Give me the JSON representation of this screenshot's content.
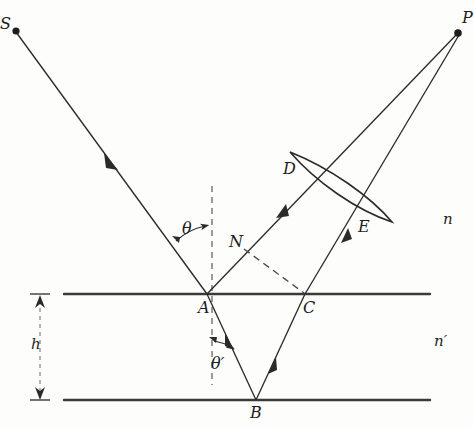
{
  "figure": {
    "colors": {
      "ink": "#2b2b2b",
      "interface": "#3a3a3a",
      "dashed": "#4a4a4a",
      "background": "#fdfdfb"
    },
    "points": {
      "S": {
        "label": "S",
        "x": 14,
        "y": 30,
        "desc": "source point"
      },
      "P": {
        "label": "P",
        "x": 458,
        "y": 32,
        "desc": "image point"
      },
      "A": {
        "label": "A",
        "x": 207,
        "y": 294,
        "desc": "incidence point on upper interface"
      },
      "B": {
        "label": "B",
        "x": 256,
        "y": 400,
        "desc": "reflection point on lower interface"
      },
      "C": {
        "label": "C",
        "x": 305,
        "y": 294,
        "desc": "exit point on upper interface"
      },
      "D": {
        "label": "D",
        "x": 293,
        "y": 170,
        "desc": "upper lens edge"
      },
      "E": {
        "label": "E",
        "x": 363,
        "y": 228,
        "desc": "lower lens edge"
      },
      "N": {
        "label": "N",
        "x": 242,
        "y": 247,
        "desc": "wavefront foot point on ray from A"
      }
    },
    "angles": {
      "theta": {
        "label": "θ",
        "desc": "angle of incidence above interface"
      },
      "theta_prime": {
        "label": "θ′",
        "desc": "refraction angle inside layer"
      }
    },
    "media": {
      "upper": {
        "label": "n",
        "desc": "refractive index above interface"
      },
      "lower": {
        "label": "n′",
        "desc": "refractive index of the layer"
      }
    },
    "dimension": {
      "h": {
        "label": "h",
        "desc": "thickness of the layer between the two interfaces"
      }
    },
    "elements": {
      "lens": "thin converging lens between D and E",
      "normal": "vertical dashed normal line through A",
      "wavefront": "dashed line from N to C"
    }
  }
}
